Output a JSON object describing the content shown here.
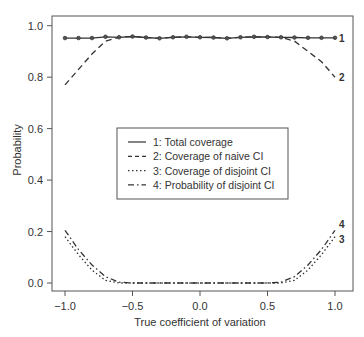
{
  "chart_data": {
    "type": "line",
    "title": "",
    "xlabel": "True coefficient of variation",
    "ylabel": "Probability",
    "xlim": [
      -1.0,
      1.0
    ],
    "ylim": [
      0.0,
      1.0
    ],
    "xticks": [
      "-1.0",
      "-0.5",
      "0.0",
      "0.5",
      "1.0"
    ],
    "yticks": [
      "0.0",
      "0.2",
      "0.4",
      "0.6",
      "0.8",
      "1.0"
    ],
    "xtick_values": [
      -1.0,
      -0.5,
      0.0,
      0.5,
      1.0
    ],
    "ytick_values": [
      0.0,
      0.2,
      0.4,
      0.6,
      0.8,
      1.0
    ],
    "grid": false,
    "legend_position": "center",
    "x": [
      -1.0,
      -0.9,
      -0.8,
      -0.7,
      -0.6,
      -0.5,
      -0.4,
      -0.3,
      -0.2,
      -0.1,
      0.0,
      0.1,
      0.2,
      0.3,
      0.4,
      0.5,
      0.6,
      0.7,
      0.8,
      0.9,
      1.0
    ],
    "series": [
      {
        "name": "1: Total coverage",
        "label": "1",
        "style": "solid-markers",
        "values": [
          0.952,
          0.952,
          0.952,
          0.957,
          0.955,
          0.958,
          0.954,
          0.951,
          0.955,
          0.957,
          0.955,
          0.954,
          0.951,
          0.955,
          0.957,
          0.956,
          0.955,
          0.954,
          0.953,
          0.953,
          0.953
        ]
      },
      {
        "name": "2: Coverage of naive CI",
        "label": "2",
        "style": "dashed",
        "values": [
          0.77,
          0.83,
          0.89,
          0.94,
          0.955,
          0.958,
          0.954,
          0.951,
          0.955,
          0.957,
          0.955,
          0.954,
          0.951,
          0.955,
          0.957,
          0.956,
          0.955,
          0.94,
          0.9,
          0.86,
          0.8
        ]
      },
      {
        "name": "3: Coverage of disjoint CI",
        "label": "3",
        "style": "dotted",
        "values": [
          0.18,
          0.11,
          0.05,
          0.01,
          0.0,
          0.0,
          0.0,
          0.0,
          0.0,
          0.0,
          0.0,
          0.0,
          0.0,
          0.0,
          0.0,
          0.0,
          0.0,
          0.01,
          0.05,
          0.11,
          0.18
        ]
      },
      {
        "name": "4: Probability of disjoint CI",
        "label": "4",
        "style": "dash-dot",
        "values": [
          0.205,
          0.13,
          0.07,
          0.025,
          0.003,
          0.0,
          0.0,
          0.0,
          0.0,
          0.0,
          0.0,
          0.0,
          0.0,
          0.0,
          0.0,
          0.0,
          0.003,
          0.025,
          0.07,
          0.13,
          0.205
        ]
      }
    ]
  },
  "legend": {
    "items": [
      {
        "label": "1: Total coverage",
        "style": "solid"
      },
      {
        "label": "2: Coverage of naive CI",
        "style": "dashed"
      },
      {
        "label": "3: Coverage of disjoint CI",
        "style": "dotted"
      },
      {
        "label": "4: Probability of disjoint CI",
        "style": "dash-dot"
      }
    ]
  },
  "colors": {
    "line": "#333333",
    "frame": "#555555",
    "text": "#333333",
    "background": "#ffffff"
  }
}
